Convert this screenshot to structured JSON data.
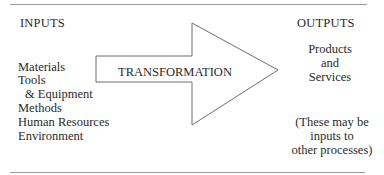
{
  "inputs": {
    "heading": "INPUTS",
    "items": [
      "Materials",
      "Tools",
      "& Equipment",
      "Methods",
      "Human Resources",
      "Environment"
    ]
  },
  "process": {
    "label": "TRANSFORMATION",
    "shape": "right-arrow"
  },
  "outputs": {
    "heading": "OUTPUTS",
    "lines": [
      "Products",
      "and",
      "Services"
    ],
    "note_lines": [
      "(These may be",
      "inputs to",
      "other processes)"
    ]
  },
  "colors": {
    "stroke": "#6e6e6e",
    "text": "#2a2a2a",
    "rule": "#9a9a9a"
  }
}
